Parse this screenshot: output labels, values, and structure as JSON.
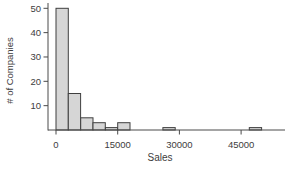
{
  "chart_data": {
    "type": "bar",
    "subtype": "histogram",
    "title": "",
    "xlabel": "Sales",
    "ylabel": "# of Companies",
    "x_ticks": [
      0,
      15000,
      30000,
      45000
    ],
    "y_ticks": [
      10,
      20,
      30,
      40,
      50
    ],
    "xlim": [
      -2000,
      55700
    ],
    "ylim": [
      0,
      52
    ],
    "grid": false,
    "legend": false,
    "colors": {
      "bar_fill": "#d6d6d6",
      "bar_stroke": "#3f3f3f",
      "axis": "#4a4a4a",
      "text": "#3d3d3d"
    },
    "bins": [
      {
        "start": 0,
        "end": 3000,
        "count": 50
      },
      {
        "start": 3000,
        "end": 6000,
        "count": 15
      },
      {
        "start": 6000,
        "end": 9000,
        "count": 5
      },
      {
        "start": 9000,
        "end": 12000,
        "count": 3
      },
      {
        "start": 12000,
        "end": 15000,
        "count": 1
      },
      {
        "start": 15000,
        "end": 18000,
        "count": 3
      },
      {
        "start": 26000,
        "end": 29000,
        "count": 1
      },
      {
        "start": 47000,
        "end": 50000,
        "count": 1
      }
    ]
  }
}
